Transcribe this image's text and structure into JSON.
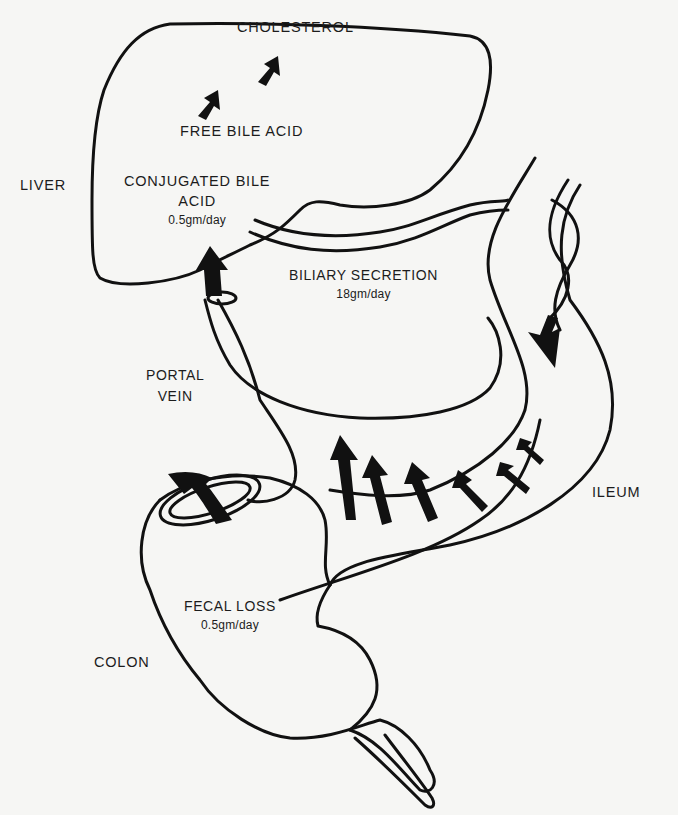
{
  "diagram": {
    "type": "enterohepatic-circulation-of-bile-acids",
    "organs": {
      "liver": "LIVER",
      "portal_vein_line1": "PORTAL",
      "portal_vein_line2": "VEIN",
      "ileum": "ILEUM",
      "colon": "COLON"
    },
    "pathway": {
      "step1": "CHOLESTEROL",
      "step2": "FREE BILE ACID",
      "step3_line1": "CONJUGATED BILE",
      "step3_line2": "ACID",
      "step3_rate": "0.5gm/day"
    },
    "flows": {
      "biliary_label": "BILIARY SECRETION",
      "biliary_rate": "18gm/day",
      "fecal_label": "FECAL LOSS",
      "fecal_rate": "0.5gm/day"
    },
    "colors": {
      "ink": "#111111",
      "paper": "#f6f6f4"
    }
  }
}
